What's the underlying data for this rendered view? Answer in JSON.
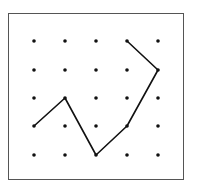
{
  "diagram": {
    "type": "dot-grid-path",
    "grid": {
      "columns": 5,
      "rows": 5
    },
    "colors": {
      "dot": "#111111",
      "line": "#111111",
      "frame": "#555555",
      "background": "#ffffff"
    },
    "path_points_grid": [
      [
        0,
        3
      ],
      [
        1,
        2
      ],
      [
        2,
        4
      ],
      [
        3,
        3
      ],
      [
        4,
        1
      ],
      [
        3,
        0
      ]
    ]
  }
}
